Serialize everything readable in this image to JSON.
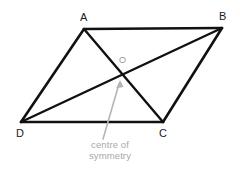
{
  "canvas": {
    "width": 240,
    "height": 169,
    "background": "#ffffff"
  },
  "colors": {
    "stroke": "#111111",
    "label": "#1a1a1a",
    "annotation": "#a8a8a8",
    "annotation_arrow": "#b5b5b5",
    "centre_label": "#9a9a9a"
  },
  "diagram": {
    "type": "parallelogram-with-diagonals",
    "vertices": [
      {
        "id": "A",
        "label": "A",
        "x": 84,
        "y": 29
      },
      {
        "id": "B",
        "label": "B",
        "x": 222,
        "y": 28
      },
      {
        "id": "C",
        "label": "C",
        "x": 163,
        "y": 122
      },
      {
        "id": "D",
        "label": "D",
        "x": 21,
        "y": 122
      }
    ],
    "sides": [
      {
        "from": "A",
        "to": "B"
      },
      {
        "from": "B",
        "to": "C"
      },
      {
        "from": "C",
        "to": "D"
      },
      {
        "from": "D",
        "to": "A"
      }
    ],
    "diagonals": [
      {
        "from": "A",
        "to": "C"
      },
      {
        "from": "B",
        "to": "D"
      }
    ],
    "centre": {
      "id": "O",
      "label": "O",
      "x": 122,
      "y": 76
    },
    "stroke_width": 2.4
  },
  "annotation": {
    "caption_line1": "centre of",
    "caption_line2": "symmetry",
    "arrow": {
      "tail_x": 103,
      "tail_y": 139,
      "head_x": 120,
      "head_y": 81
    }
  }
}
